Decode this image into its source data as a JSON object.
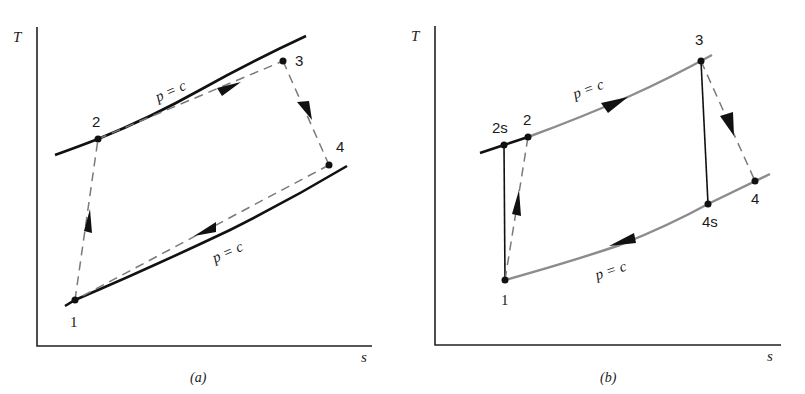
{
  "figure": {
    "panels": [
      {
        "id": "a",
        "caption": "(a)",
        "y_axis_label": "T",
        "x_axis_label": "s",
        "isobar_label_upper": "p = c",
        "isobar_label_lower": "p = c",
        "states": [
          {
            "label": "1",
            "description": "compressor inlet"
          },
          {
            "label": "2",
            "description": "compressor exit"
          },
          {
            "label": "3",
            "description": "turbine inlet"
          },
          {
            "label": "4",
            "description": "turbine exit"
          }
        ],
        "style": "all processes dashed (irreversible), isobars solid black"
      },
      {
        "id": "b",
        "caption": "(b)",
        "y_axis_label": "T",
        "x_axis_label": "s",
        "isobar_label_upper": "p = c",
        "isobar_label_lower": "p = c",
        "states": [
          {
            "label": "1"
          },
          {
            "label": "2s"
          },
          {
            "label": "2"
          },
          {
            "label": "3"
          },
          {
            "label": "4s"
          },
          {
            "label": "4"
          }
        ],
        "style": "isentropic 1-2s and 3-4s solid vertical, actual 1-2 and 3-4 dashed, isobars gray"
      }
    ],
    "colors": {
      "line_dark": "#111111",
      "isobar_gray": "#8c8c8c",
      "dashed_gray": "#7a7a7a",
      "background": "#ffffff"
    }
  }
}
